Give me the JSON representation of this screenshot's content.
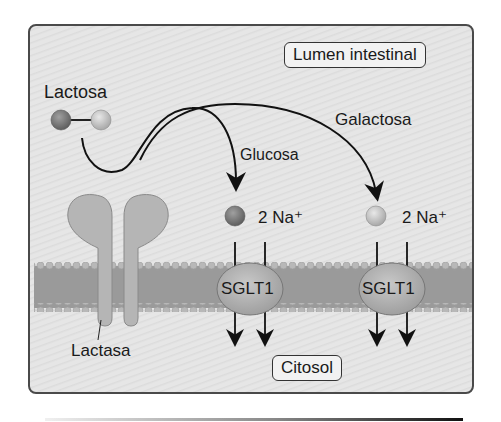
{
  "diagram": {
    "regions": {
      "lumen_label": "Lumen intestinal",
      "cytosol_label": "Citosol"
    },
    "molecules": {
      "lactose_label": "Lactosa",
      "glucose_label": "Glucosa",
      "galactose_label": "Galactosa"
    },
    "enzyme": {
      "label": "Lactasa"
    },
    "transporters": [
      {
        "label": "SGLT1",
        "cotransport": "2 Na⁺",
        "substrate": "Glucosa"
      },
      {
        "label": "SGLT1",
        "cotransport": "2 Na⁺",
        "substrate": "Galactosa"
      }
    ],
    "colors": {
      "panel_bg": "#e4e4e4",
      "membrane": "#9a9a9a",
      "lipid_head": "#b8b8b8",
      "glucose": "#7a7a7a",
      "galactose": "#c8c8c8",
      "protein": "#b5b5b5",
      "text": "#1a1a1a"
    }
  }
}
